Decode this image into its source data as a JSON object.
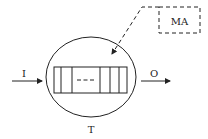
{
  "diagram": {
    "input_label": "I",
    "output_label": "O",
    "bottom_label": "T",
    "box_label": "MA",
    "colors": {
      "stroke": "#222222",
      "background": "#ffffff"
    }
  }
}
